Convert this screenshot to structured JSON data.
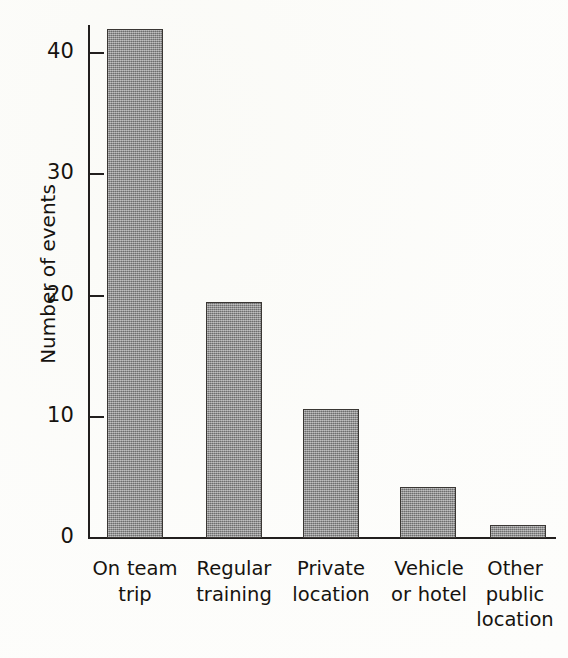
{
  "chart_data": {
    "type": "bar",
    "title": "",
    "subtitle": "",
    "xlabel": "",
    "ylabel": "Number of events",
    "categories": [
      "On team trip",
      "Regular training",
      "Private location",
      "Vehicle or hotel",
      "Other public location"
    ],
    "category_lines": [
      [
        "On team",
        "trip"
      ],
      [
        "Regular",
        "training"
      ],
      [
        "Private",
        "location"
      ],
      [
        "Vehicle",
        "or hotel"
      ],
      [
        "Other",
        "public",
        "location"
      ]
    ],
    "values": [
      42,
      19.5,
      10.6,
      4.2,
      1.1
    ],
    "ylim": [
      0,
      43
    ],
    "yticks": [
      0,
      10,
      20,
      30,
      40
    ],
    "ytick_labels": [
      "0",
      "10",
      "20",
      "30",
      "40"
    ],
    "grid": false,
    "legend": false,
    "legend_position": "none",
    "bar_fill_color": "#8b8b8b",
    "bar_edge_color": "#3a3734",
    "axis_color": "#221f1e",
    "text_color": "#16130f",
    "background_color": "#fdfdfb"
  }
}
